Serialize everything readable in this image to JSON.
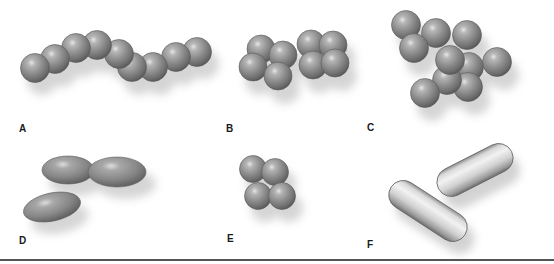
{
  "figure": {
    "panels": [
      {
        "id": "A",
        "label": "A",
        "shape": "cocci-chain",
        "description": "streptococci (chain of spheres)"
      },
      {
        "id": "B",
        "label": "B",
        "shape": "cocci-tetrads",
        "description": "two groups of four spheres"
      },
      {
        "id": "C",
        "label": "C",
        "shape": "cocci-cluster",
        "description": "staphylococci (irregular cluster)"
      },
      {
        "id": "D",
        "label": "D",
        "shape": "diplococci-oval",
        "description": "oval cells in pair and single"
      },
      {
        "id": "E",
        "label": "E",
        "shape": "cocci-tetrad",
        "description": "single group of four spheres"
      },
      {
        "id": "F",
        "label": "F",
        "shape": "bacilli",
        "description": "two rod-shaped cells"
      }
    ]
  },
  "colors": {
    "cell_fill": "#8a8a8a",
    "cell_highlight": "#e8e8e8",
    "cell_edge": "#4d4d4d",
    "rod_fill": "#cfcfcf",
    "shadow": "#bdbdbd",
    "divider": "#555555",
    "label": "#1a1a1a"
  }
}
